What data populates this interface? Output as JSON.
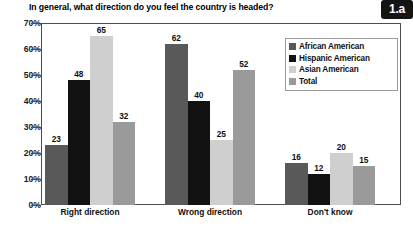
{
  "header": {
    "title": "In general, what direction do you feel the country is headed?",
    "badge_label": "1.a"
  },
  "legend": {
    "position": "inside-top-right",
    "items": [
      {
        "label": "African American",
        "color": "#595959",
        "swatch_name": "legend-swatch-african-american"
      },
      {
        "label": "Hispanic American",
        "color": "#121212",
        "swatch_name": "legend-swatch-hispanic-american"
      },
      {
        "label": "Asian American",
        "color": "#cfcfcf",
        "swatch_name": "legend-swatch-asian-american"
      },
      {
        "label": "Total",
        "color": "#9a9a9a",
        "swatch_name": "legend-swatch-total"
      }
    ]
  },
  "axes": {
    "y_ticks": [
      "0%",
      "10%",
      "20%",
      "30%",
      "40%",
      "50%",
      "60%",
      "70%"
    ],
    "x_ticks": [
      "Right direction",
      "Wrong direction",
      "Don't know"
    ]
  },
  "chart_data": {
    "type": "bar",
    "title": "In general, what direction do you feel the country is headed?",
    "xlabel": "",
    "ylabel": "",
    "ylim": [
      0,
      70
    ],
    "ytick_step": 10,
    "ytick_suffix": "%",
    "grid": false,
    "categories": [
      "Right direction",
      "Wrong direction",
      "Don't know"
    ],
    "series": [
      {
        "name": "African American",
        "color": "#595959",
        "values": [
          23,
          62,
          16
        ]
      },
      {
        "name": "Hispanic American",
        "color": "#121212",
        "values": [
          48,
          40,
          12
        ]
      },
      {
        "name": "Asian American",
        "color": "#cfcfcf",
        "values": [
          65,
          25,
          20
        ]
      },
      {
        "name": "Total",
        "color": "#9a9a9a",
        "values": [
          32,
          52,
          15
        ]
      }
    ],
    "data_labels": [
      [
        23,
        48,
        65,
        32
      ],
      [
        62,
        40,
        25,
        52
      ],
      [
        16,
        12,
        20,
        15
      ]
    ]
  }
}
